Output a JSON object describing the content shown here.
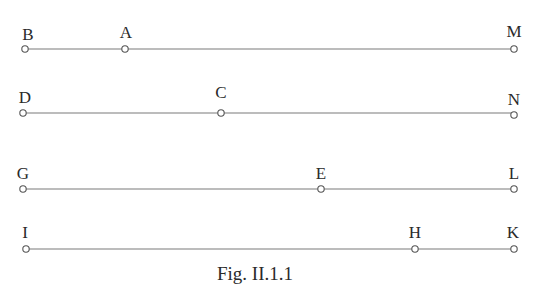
{
  "figure": {
    "caption": "Fig. II.1.1",
    "rows": [
      {
        "y": 49,
        "points": [
          {
            "label": "B",
            "x": 25
          },
          {
            "label": "A",
            "x": 125
          },
          {
            "label": "M",
            "x": 514
          }
        ]
      },
      {
        "y": 113,
        "points": [
          {
            "label": "D",
            "x": 23
          },
          {
            "label": "C",
            "x": 221
          },
          {
            "label": "N",
            "x": 514
          }
        ]
      },
      {
        "y": 189,
        "points": [
          {
            "label": "G",
            "x": 23
          },
          {
            "label": "E",
            "x": 321
          },
          {
            "label": "L",
            "x": 514
          }
        ]
      },
      {
        "y": 249,
        "points": [
          {
            "label": "I",
            "x": 26
          },
          {
            "label": "H",
            "x": 415
          },
          {
            "label": "K",
            "x": 514
          }
        ]
      }
    ]
  }
}
